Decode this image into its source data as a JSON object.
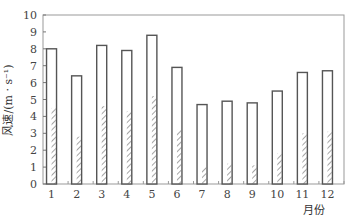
{
  "chart_data": {
    "type": "bar",
    "title": "",
    "xlabel": "月份",
    "ylabel": "风速/(m · s⁻¹)",
    "ylim": [
      0,
      10
    ],
    "yticks": [
      0,
      1,
      2,
      3,
      4,
      5,
      6,
      7,
      8,
      9,
      10
    ],
    "grid": false,
    "legend": null,
    "categories": [
      "1",
      "2",
      "3",
      "4",
      "5",
      "6",
      "7",
      "8",
      "9",
      "10",
      "11",
      "12"
    ],
    "series": [
      {
        "name": "open-bar",
        "style": "outline",
        "values": [
          8.0,
          6.4,
          8.2,
          7.9,
          8.8,
          6.9,
          4.7,
          4.9,
          4.8,
          5.5,
          6.6,
          6.7
        ]
      },
      {
        "name": "hatched-bar",
        "style": "hatched",
        "values": [
          4.5,
          2.8,
          4.6,
          4.3,
          5.2,
          3.2,
          1.0,
          1.2,
          1.1,
          1.8,
          3.0,
          3.1
        ]
      }
    ],
    "colors": {
      "stroke": "#555555",
      "hatch": "#666666",
      "frame": "#999999"
    }
  }
}
